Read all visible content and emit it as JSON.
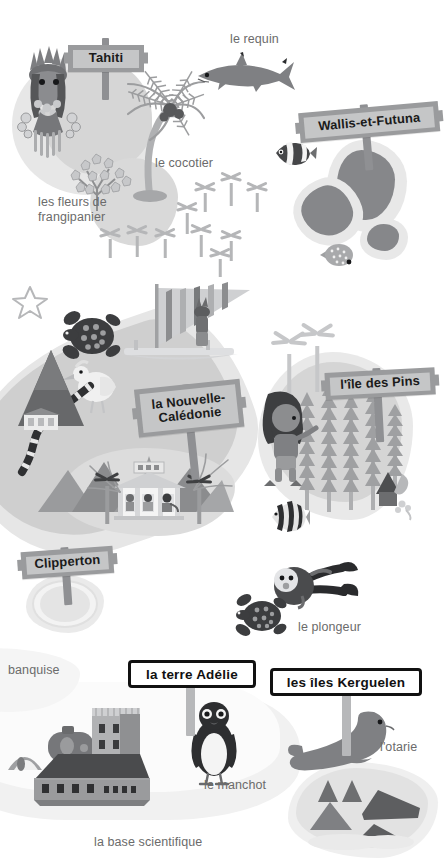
{
  "page": {
    "width": 443,
    "height": 852,
    "background": "#ffffff",
    "palette": {
      "ink": "#1b1b1b",
      "caption_text": "#6b6b6b",
      "sign_wood": "#9a9b9d",
      "sign_panel": "#c5c6c7",
      "sign_post": "#8f9093",
      "land_dark": "#7f8083",
      "land_mid": "#a9aaac",
      "land_light": "#d9d9d9",
      "sea_halo": "#ededed",
      "snow": "#f2f2f2",
      "white": "#ffffff",
      "black": "#111111"
    }
  },
  "signposts": [
    {
      "id": "tahiti",
      "label": "Tahiti",
      "style": "wood",
      "font_size": 13
    },
    {
      "id": "wallis-et-futuna",
      "label": "Wallis-et-Futuna",
      "style": "wood",
      "font_size": 13
    },
    {
      "id": "nouvelle-caledonie",
      "label": "la Nouvelle-\nCalédonie",
      "style": "wood",
      "font_size": 13
    },
    {
      "id": "ile-des-pins",
      "label": "l'île des Pins",
      "style": "wood",
      "font_size": 13
    },
    {
      "id": "clipperton",
      "label": "Clipperton",
      "style": "wood",
      "font_size": 13
    },
    {
      "id": "terre-adelie",
      "label": "la terre Adélie",
      "style": "plate",
      "font_size": 13.5
    },
    {
      "id": "iles-kerguelen",
      "label": "les îles Kerguelen",
      "style": "plate",
      "font_size": 13.5
    }
  ],
  "captions": [
    {
      "id": "le-requin",
      "text": "le requin"
    },
    {
      "id": "le-cocotier",
      "text": "le cocotier"
    },
    {
      "id": "les-fleurs",
      "text": "les fleurs de\nfrangipanier"
    },
    {
      "id": "le-plongeur",
      "text": "le plongeur"
    },
    {
      "id": "la-banquise",
      "text": "banquise"
    },
    {
      "id": "le-manchot",
      "text": "le manchot"
    },
    {
      "id": "la-base",
      "text": "la base scientifique"
    },
    {
      "id": "l-otarie",
      "text": "l'otarie"
    }
  ],
  "illustrations": [
    {
      "id": "tahitian-dancer",
      "name": "danseuse tahitienne"
    },
    {
      "id": "shark",
      "name": "requin"
    },
    {
      "id": "clownfish",
      "name": "poisson-clown"
    },
    {
      "id": "butterflyfish",
      "name": "poisson papillon"
    },
    {
      "id": "starfish",
      "name": "étoile de mer"
    },
    {
      "id": "sea-turtle",
      "name": "tortue de mer"
    },
    {
      "id": "outrigger-canoe",
      "name": "pirogue à voile"
    },
    {
      "id": "cagou-bird",
      "name": "cagou"
    },
    {
      "id": "pavilion",
      "name": "kiosque à musique"
    },
    {
      "id": "pine-forest",
      "name": "pins colonnaires"
    },
    {
      "id": "islander-child",
      "name": "enfant"
    },
    {
      "id": "angelfish",
      "name": "poisson ange"
    },
    {
      "id": "scuba-diver",
      "name": "plongeur"
    },
    {
      "id": "turtle-small",
      "name": "petite tortue"
    },
    {
      "id": "penguin",
      "name": "manchot"
    },
    {
      "id": "research-base",
      "name": "base scientifique"
    },
    {
      "id": "sea-lion",
      "name": "otarie"
    },
    {
      "id": "coconut-palm",
      "name": "cocotier"
    },
    {
      "id": "frangipani",
      "name": "frangipanier"
    }
  ]
}
